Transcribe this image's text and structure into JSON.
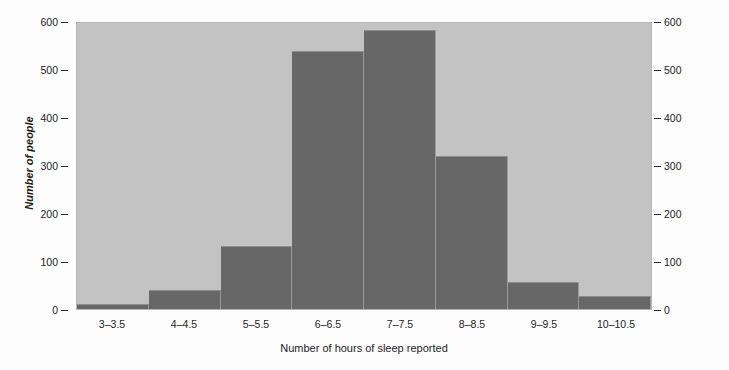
{
  "chart_data": {
    "type": "bar",
    "title": "",
    "subtitle": "",
    "xlabel": "Number of hours of sleep reported",
    "ylabel": "Number of people",
    "categories": [
      "3–3.5",
      "4–4.5",
      "5–5.5",
      "6–6.5",
      "7–7.5",
      "8–8.5",
      "9–9.5",
      "10–10.5"
    ],
    "values": [
      10,
      40,
      133,
      542,
      585,
      322,
      57,
      28
    ],
    "ylim": [
      0,
      600
    ],
    "yticks": [
      0,
      100,
      200,
      300,
      400,
      500,
      600
    ],
    "ytick_labels_left": [
      "0",
      "100",
      "200",
      "300",
      "400",
      "500",
      "600"
    ],
    "ytick_labels_right": [
      "0",
      "100",
      "200",
      "300",
      "400",
      "500",
      "600"
    ],
    "grid": false,
    "legend": null,
    "annotations": [],
    "colors": {
      "bar": "#676767",
      "plot_background": "#c3c3c3",
      "figure_background": "#fdfdfd",
      "text": "#1c1c1c",
      "tick_mark": "#2a2a2a"
    }
  }
}
